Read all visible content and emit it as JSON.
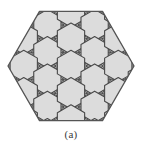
{
  "figure": {
    "caption": "(a)",
    "shape_kind": "regular-hexagon",
    "orientation": "flat-top",
    "colors": {
      "fill": "#dcdcdc",
      "stroke": "#4a4a4a",
      "boundary_stroke": "#555555",
      "background": "#ffffff",
      "caption_color": "#3b3b3b"
    },
    "geometry": {
      "center_x": 71,
      "center_y": 66,
      "circumradius": 63,
      "triangle_edge": 15.75,
      "rows": 8,
      "stroke_width": 0.9,
      "boundary_stroke_width": 1.3
    },
    "tiling": {
      "type": "triangular-lattice-with-hexagon-cells",
      "hexagon_cells": [
        {
          "row": 1,
          "col": 1
        },
        {
          "row": 1,
          "col": 2
        },
        {
          "row": 1,
          "col": 3
        },
        {
          "row": 2,
          "col": 0
        },
        {
          "row": 2,
          "col": 2
        },
        {
          "row": 2,
          "col": 4
        },
        {
          "row": 3,
          "col": 0
        },
        {
          "row": 3,
          "col": 1
        },
        {
          "row": 3,
          "col": 3
        },
        {
          "row": 3,
          "col": 4
        },
        {
          "row": 4,
          "col": 0
        },
        {
          "row": 4,
          "col": 2
        },
        {
          "row": 4,
          "col": 4
        },
        {
          "row": 5,
          "col": 1
        },
        {
          "row": 5,
          "col": 2
        },
        {
          "row": 5,
          "col": 3
        }
      ]
    }
  }
}
